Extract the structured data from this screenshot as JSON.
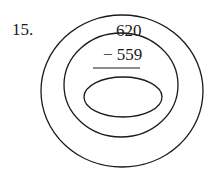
{
  "problem": {
    "number_label": "15.",
    "minuend": "620",
    "subtrahend": "− 559",
    "answer": ""
  },
  "diagram": {
    "stroke_color": "#1a1a1a",
    "outer_ellipse": {
      "cx": 122,
      "cy": 91,
      "rx": 81,
      "ry": 76
    },
    "middle_ellipse": {
      "cx": 121,
      "cy": 85,
      "rx": 57,
      "ry": 52
    },
    "inner_ellipse": {
      "cx": 123,
      "cy": 97,
      "rx": 39,
      "ry": 20
    },
    "answer_line": {
      "x1": 93,
      "x2": 140,
      "y": 68
    }
  }
}
